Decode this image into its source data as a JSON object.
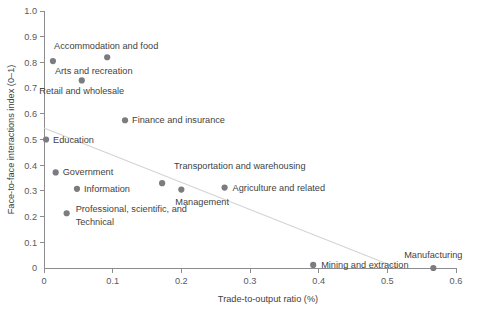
{
  "chart_data": {
    "type": "scatter",
    "title": "",
    "xlabel": "Trade-to-output ratio (%)",
    "ylabel": "Face-to-face interactions index (0–1)",
    "xlim": [
      0,
      0.6
    ],
    "ylim": [
      0,
      1.0
    ],
    "xticks": [
      "0",
      "0.1",
      "0.2",
      "0.3",
      "0.4",
      "0.5",
      "0.6"
    ],
    "xtick_values": [
      0,
      0.1,
      0.2,
      0.3,
      0.4,
      0.5,
      0.6
    ],
    "yticks": [
      "0",
      "0.1",
      "0.2",
      "0.3",
      "0.4",
      "0.5",
      "0.6",
      "0.7",
      "0.8",
      "0.9",
      "1.0"
    ],
    "ytick_values": [
      0,
      0.1,
      0.2,
      0.3,
      0.4,
      0.5,
      0.6,
      0.7,
      0.8,
      0.9,
      1.0
    ],
    "grid": false,
    "legend": "none",
    "marker_color": "#7c7c80",
    "trendline_color": "#d4d4d4",
    "trendline": {
      "x": [
        0.0,
        0.515
      ],
      "y": [
        0.545,
        0.0
      ]
    },
    "points": [
      {
        "label": "Arts and recreation",
        "x": 0.013,
        "y": 0.805,
        "label_dx": 2,
        "label_dy": 13,
        "anchor": "start"
      },
      {
        "label": "Accommodation and food",
        "x": 0.092,
        "y": 0.82,
        "label_dx": -1,
        "label_dy": -8,
        "anchor": "middle"
      },
      {
        "label": "Retail and wholesale",
        "x": 0.055,
        "y": 0.73,
        "label_dx": 0,
        "label_dy": 14,
        "anchor": "middle"
      },
      {
        "label": "Finance and insurance",
        "x": 0.118,
        "y": 0.575,
        "label_dx": 7,
        "label_dy": 3,
        "anchor": "start"
      },
      {
        "label": "Education",
        "x": 0.003,
        "y": 0.5,
        "label_dx": 7,
        "label_dy": 3,
        "anchor": "start"
      },
      {
        "label": "Government",
        "x": 0.017,
        "y": 0.372,
        "label_dx": 7,
        "label_dy": 3,
        "anchor": "start"
      },
      {
        "label": "Information",
        "x": 0.048,
        "y": 0.308,
        "label_dx": 7,
        "label_dy": 3,
        "anchor": "start"
      },
      {
        "label": "Professional, scientific, and",
        "x": 0.033,
        "y": 0.213,
        "label_dx": 9,
        "label_dy": -1,
        "anchor": "start"
      },
      {
        "label": "Technical",
        "x": 0.033,
        "y": 0.213,
        "label_dx": 9,
        "label_dy": 12,
        "anchor": "start",
        "continuation": true
      },
      {
        "label": "Transportation and warehousing",
        "x": 0.172,
        "y": 0.33,
        "label_dx": 12,
        "label_dy": -14,
        "anchor": "start"
      },
      {
        "label": "Management",
        "x": 0.2,
        "y": 0.305,
        "label_dx": -6,
        "label_dy": 15,
        "anchor": "start"
      },
      {
        "label": "Agriculture and related",
        "x": 0.263,
        "y": 0.313,
        "label_dx": 8,
        "label_dy": 3,
        "anchor": "start"
      },
      {
        "label": "Mining and extraction",
        "x": 0.392,
        "y": 0.012,
        "label_dx": 8,
        "label_dy": 3,
        "anchor": "start"
      },
      {
        "label": "Manufacturing",
        "x": 0.567,
        "y": 0.0,
        "label_dx": 0,
        "label_dy": -10,
        "anchor": "middle"
      }
    ]
  }
}
